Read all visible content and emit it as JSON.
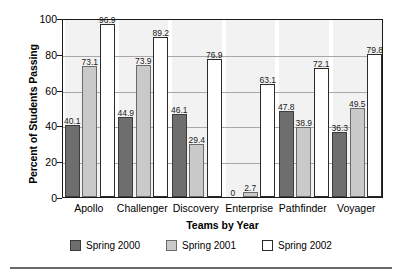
{
  "chart_data": {
    "type": "bar",
    "title": "",
    "xlabel": "Teams by Year",
    "ylabel": "Percent of Students Passing",
    "categories": [
      "Apollo",
      "Challenger",
      "Discovery",
      "Enterprise",
      "Pathfinder",
      "Voyager"
    ],
    "series": [
      {
        "name": "Spring 2000",
        "color": "#6e6e6e",
        "values": [
          40.1,
          44.9,
          46.1,
          0,
          47.8,
          36.3
        ]
      },
      {
        "name": "Spring 2001",
        "color": "#c9c9c9",
        "values": [
          73.1,
          73.9,
          29.4,
          2.7,
          38.9,
          49.5
        ]
      },
      {
        "name": "Spring 2002",
        "color": "#ffffff",
        "values": [
          96.9,
          89.2,
          76.9,
          63.1,
          72.1,
          79.8
        ]
      }
    ],
    "ylim": [
      0,
      100
    ],
    "yticks": [
      0,
      20,
      40,
      60,
      80,
      100
    ],
    "grid": true,
    "legend_position": "bottom"
  }
}
